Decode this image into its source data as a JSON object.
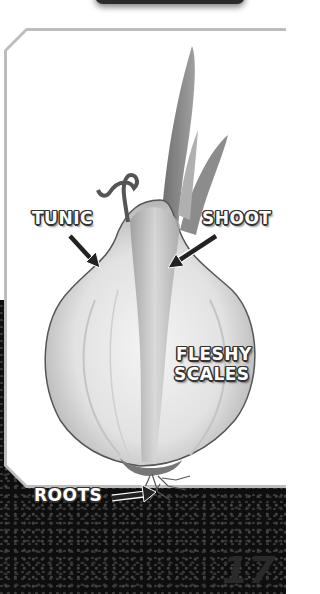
{
  "figure": {
    "labels": {
      "tunic": "TUNIC",
      "shoot": "SHOOT",
      "fleshy_scales_line1": "FLESHY",
      "fleshy_scales_line2": "SCALES",
      "roots": "ROOTS"
    }
  },
  "page": {
    "number": "17"
  }
}
